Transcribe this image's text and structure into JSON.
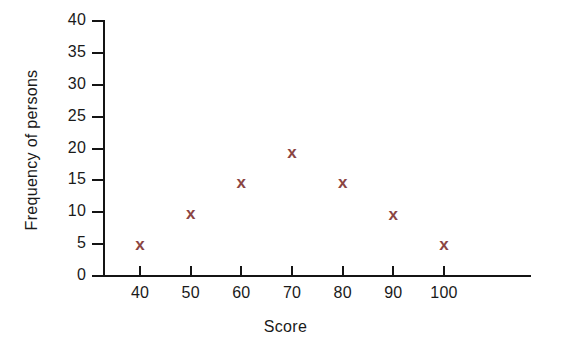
{
  "chart_data": {
    "type": "scatter",
    "title": "",
    "xlabel": "Score",
    "ylabel": "Frequency of persons",
    "x": [
      40,
      50,
      60,
      70,
      80,
      90,
      100
    ],
    "values": [
      4.8,
      9.8,
      14.6,
      19.3,
      14.6,
      9.6,
      4.8
    ],
    "series": [
      {
        "name": "Frequency of persons",
        "marker": "x",
        "color": "#8B4543",
        "points": [
          {
            "x": 40,
            "y": 4.8
          },
          {
            "x": 50,
            "y": 9.8
          },
          {
            "x": 60,
            "y": 14.6
          },
          {
            "x": 70,
            "y": 19.3
          },
          {
            "x": 80,
            "y": 14.6
          },
          {
            "x": 90,
            "y": 9.6
          },
          {
            "x": 100,
            "y": 4.8
          }
        ]
      }
    ],
    "xlim": [
      35,
      105
    ],
    "ylim": [
      0,
      40
    ],
    "xticks": [
      40,
      50,
      60,
      70,
      80,
      90,
      100
    ],
    "yticks": [
      0,
      5,
      10,
      15,
      20,
      25,
      30,
      35,
      40
    ],
    "xtick_labels": [
      "40",
      "50",
      "60",
      "70",
      "80",
      "90",
      "100"
    ],
    "ytick_labels": [
      "0",
      "5",
      "10",
      "15",
      "20",
      "25",
      "30",
      "35",
      "40"
    ],
    "grid": false,
    "legend": false,
    "legend_position": "none",
    "axis_color": "#141414",
    "background_color": "#ffffff"
  }
}
